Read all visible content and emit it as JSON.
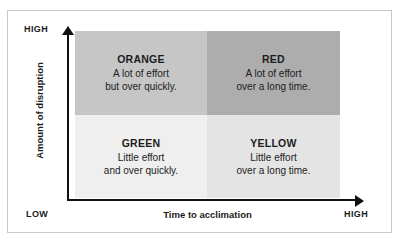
{
  "chart_data": {
    "type": "table",
    "title": "",
    "xlabel": "Time to acclimation",
    "ylabel": "Amount of disruption",
    "x_axis_low_label": "LOW",
    "x_axis_high_label": "HIGH",
    "y_axis_low_label": "LOW",
    "y_axis_high_label": "HIGH",
    "grid": false,
    "legend": "none",
    "quadrants": [
      {
        "id": "orange",
        "title": "ORANGE",
        "lines": [
          "A lot of effort",
          "but over quickly."
        ],
        "x_position": "low",
        "y_position": "high",
        "fill": "#c6c6c6"
      },
      {
        "id": "red",
        "title": "RED",
        "lines": [
          "A lot of effort",
          "over a long time."
        ],
        "x_position": "high",
        "y_position": "high",
        "fill": "#adadad"
      },
      {
        "id": "green",
        "title": "GREEN",
        "lines": [
          "Little effort",
          "and over quickly."
        ],
        "x_position": "low",
        "y_position": "low",
        "fill": "#efefef"
      },
      {
        "id": "yellow",
        "title": "YELLOW",
        "lines": [
          "Little effort",
          "over a long time."
        ],
        "x_position": "high",
        "y_position": "low",
        "fill": "#e4e4e4"
      }
    ]
  },
  "axes": {
    "y_high": "HIGH",
    "y_title": "Amount of disruption",
    "x_low": "LOW",
    "x_title": "Time to acclimation",
    "x_high": "HIGH"
  }
}
